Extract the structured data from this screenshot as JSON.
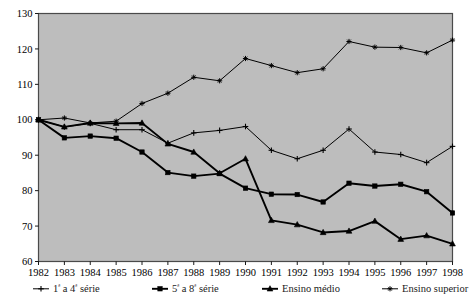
{
  "chart_data": {
    "type": "line",
    "title": "",
    "xlabel": "",
    "ylabel": "",
    "xlim": [
      1982,
      1998
    ],
    "ylim": [
      60,
      130
    ],
    "grid": false,
    "legend_position": "bottom",
    "plot_background": "#bdbdbd",
    "line_color": "#000000",
    "categories": [
      "1982",
      "1983",
      "1984",
      "1985",
      "1986",
      "1987",
      "1988",
      "1989",
      "1990",
      "1991",
      "1992",
      "1993",
      "1994",
      "1995",
      "1996",
      "1997",
      "1998"
    ],
    "yticks": [
      60,
      70,
      80,
      90,
      100,
      110,
      120,
      130
    ],
    "series": [
      {
        "name": "1ª a 4ª série",
        "marker": "plus",
        "values": [
          100.0,
          98.0,
          99.0,
          97.2,
          97.2,
          93.4,
          96.3,
          97.0,
          98.1,
          91.4,
          89.0,
          91.4,
          97.4,
          90.9,
          90.2,
          87.9,
          92.5
        ]
      },
      {
        "name": "5ª a 8ª série",
        "marker": "square",
        "values": [
          100.0,
          94.9,
          95.4,
          94.8,
          90.9,
          85.1,
          84.1,
          84.8,
          80.7,
          79.0,
          78.9,
          76.8,
          82.1,
          81.3,
          81.8,
          79.7,
          73.7
        ]
      },
      {
        "name": "Ensino médio",
        "marker": "triangle",
        "values": [
          100.0,
          98.0,
          99.1,
          99.0,
          99.1,
          93.2,
          90.9,
          84.9,
          89.0,
          71.6,
          70.4,
          68.2,
          68.6,
          71.4,
          66.3,
          67.3,
          65.0
        ]
      },
      {
        "name": "Ensino superior",
        "marker": "cross",
        "values": [
          100.0,
          100.5,
          99.1,
          99.6,
          104.6,
          107.5,
          112.0,
          111.0,
          117.3,
          115.3,
          113.3,
          114.4,
          122.1,
          120.5,
          120.4,
          118.9,
          122.5
        ]
      }
    ]
  },
  "legend": {
    "items": [
      {
        "prefix": "1",
        "sup": "ª",
        "mid": " a 4",
        "sup2": "ª",
        "suffix": " série",
        "full": "1ª a 4ª série"
      },
      {
        "prefix": "5",
        "sup": "ª",
        "mid": " a 8",
        "sup2": "ª",
        "suffix": " série",
        "full": "5ª a 8ª série"
      },
      {
        "full": "Ensino médio"
      },
      {
        "full": "Ensino superior"
      }
    ]
  }
}
